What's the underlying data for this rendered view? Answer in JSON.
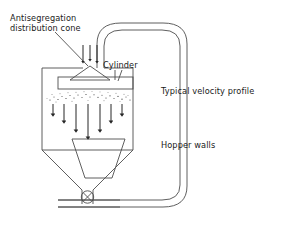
{
  "figure": {
    "type": "process-flow-line-diagram",
    "background_color": "#ffffff",
    "line_color": "#4d4d4d",
    "text_color": "#1a1a1a"
  },
  "labels": {
    "antisegregation_line1": "Antisegregation",
    "antisegregation_line2": "distribution cone",
    "cylinder": "Cylinder",
    "velocity_profile": "Typical velocity profile",
    "hopper_walls": "Hopper walls"
  },
  "components": {
    "vessel": "silo-body",
    "cone": "antisegregation-distribution-cone",
    "cylinder": "cylinder-shroud",
    "insert": "hopper-insert-cone",
    "outlet_valve": "crossed-circle-valve",
    "recycle_pipe": "recycle-pipe-loop",
    "ground": "ground-support-line"
  },
  "velocity_profile": {
    "description": "Downward flow arrows forming a parabolic velocity profile, longest at center",
    "arrow_count": 7,
    "x_positions": [
      53,
      64,
      76,
      88,
      100,
      111,
      122
    ],
    "arrow_lengths": [
      14,
      21,
      30,
      37,
      30,
      21,
      14
    ],
    "top_y": 103,
    "direction": "down"
  },
  "inlet_arrows": {
    "description": "Feed stream arrows entering from pipe onto cone apex",
    "count": 3,
    "x_positions": [
      83,
      90,
      97
    ],
    "top_y": 45,
    "bottom_y": 68,
    "direction": "down"
  },
  "particle_band": {
    "description": "Speckled band of dispersed particles below the cylinder",
    "top_y": 94,
    "bottom_y": 103
  }
}
